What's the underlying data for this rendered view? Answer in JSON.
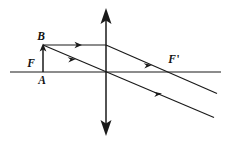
{
  "figure": {
    "type": "optics-ray-diagram",
    "width": 231,
    "height": 144,
    "background_color": "#ffffff",
    "line_color": "#1a1a1a"
  },
  "labels": {
    "object_top": "B",
    "object_base": "A",
    "focal_point_object_side": "F",
    "focal_point_image_side": "F",
    "focal_point_image_side_prime": "'"
  },
  "elements": {
    "principal_axis": "principal-axis",
    "lens": "converging-lens-double-arrow",
    "object": "object-arrow-AB",
    "ray_parallel": "ray-parallel-to-axis",
    "ray_refracted": "refracted-ray-through-focal-point",
    "ray_center": "ray-through-optical-center"
  },
  "geometry": {
    "axis": {
      "x1": 10,
      "y": 72,
      "x2": 221
    },
    "lens": {
      "x": 106,
      "y_top": 10,
      "y_bottom": 133
    },
    "object": {
      "x": 43,
      "y_base": 72,
      "y_top": 45
    },
    "focal_left": {
      "x": 43,
      "y": 72
    },
    "focal_right": {
      "x": 167,
      "y": 72
    },
    "ray1_in": {
      "x1": 43,
      "y1": 45,
      "x2": 106,
      "y2": 45
    },
    "ray1_out": {
      "x1": 106,
      "y1": 45,
      "x2": 216,
      "y2": 93
    },
    "ray2": {
      "x1": 43,
      "y1": 45,
      "x2": 213,
      "y2": 117
    },
    "arrow_markers": [
      {
        "x": 78,
        "y": 45,
        "angle": 0
      },
      {
        "x": 72,
        "y": 58,
        "angle": 23
      },
      {
        "x": 148,
        "y": 62,
        "angle": 23
      },
      {
        "x": 158,
        "y": 92,
        "angle": 23
      }
    ]
  },
  "label_positions": {
    "B": {
      "x": 41,
      "y": 40
    },
    "A": {
      "x": 40,
      "y": 84
    },
    "F": {
      "x": 28,
      "y": 67
    },
    "Fprime": {
      "x": 168,
      "y": 64
    }
  }
}
